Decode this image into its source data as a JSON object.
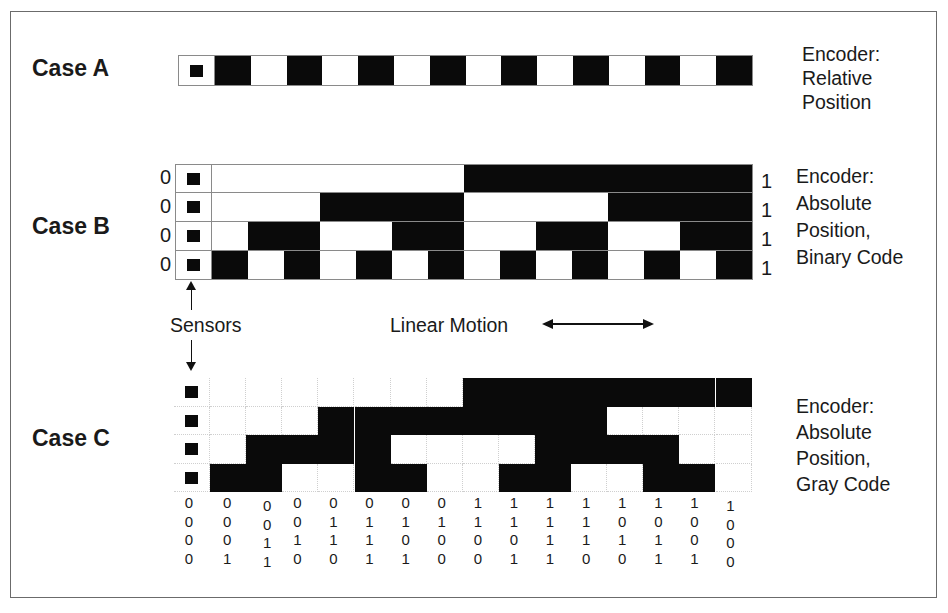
{
  "caseA": {
    "label": "Case A",
    "description": [
      "Encoder:",
      "Relative",
      "Position"
    ],
    "pattern": [
      1,
      0,
      1,
      0,
      1,
      0,
      1,
      0,
      1,
      0,
      1,
      0,
      1,
      0,
      1
    ]
  },
  "caseB": {
    "label": "Case B",
    "description": [
      "Encoder:",
      "Absolute",
      "Position,",
      "Binary Code"
    ],
    "left_bits": [
      "0",
      "0",
      "0",
      "0"
    ],
    "right_bits": [
      "1",
      "1",
      "1",
      "1"
    ],
    "rows": [
      [
        0,
        0,
        0,
        0,
        0,
        0,
        0,
        0,
        1,
        1,
        1,
        1,
        1,
        1,
        1,
        1
      ],
      [
        0,
        0,
        0,
        0,
        1,
        1,
        1,
        1,
        0,
        0,
        0,
        0,
        1,
        1,
        1,
        1
      ],
      [
        0,
        0,
        1,
        1,
        0,
        0,
        1,
        1,
        0,
        0,
        1,
        1,
        0,
        0,
        1,
        1
      ],
      [
        0,
        1,
        0,
        1,
        0,
        1,
        0,
        1,
        0,
        1,
        0,
        1,
        0,
        1,
        0,
        1
      ]
    ]
  },
  "caseC": {
    "label": "Case C",
    "description": [
      "Encoder:",
      "Absolute",
      "Position,",
      "Gray Code"
    ],
    "rows": [
      [
        0,
        0,
        0,
        0,
        0,
        0,
        0,
        0,
        1,
        1,
        1,
        1,
        1,
        1,
        1,
        1
      ],
      [
        0,
        0,
        0,
        0,
        1,
        1,
        1,
        1,
        1,
        1,
        1,
        1,
        0,
        0,
        0,
        0
      ],
      [
        0,
        0,
        1,
        1,
        1,
        1,
        0,
        0,
        0,
        0,
        1,
        1,
        1,
        1,
        0,
        0
      ],
      [
        0,
        1,
        1,
        0,
        0,
        1,
        1,
        0,
        0,
        1,
        1,
        0,
        0,
        1,
        1,
        0
      ]
    ],
    "code_columns": [
      [
        "0",
        "0",
        "0",
        "0"
      ],
      [
        "0",
        "0",
        "0",
        "1"
      ],
      [
        "0",
        "0",
        "1",
        "1"
      ],
      [
        "0",
        "0",
        "1",
        "0"
      ],
      [
        "0",
        "1",
        "1",
        "0"
      ],
      [
        "0",
        "1",
        "1",
        "1"
      ],
      [
        "0",
        "1",
        "0",
        "1"
      ],
      [
        "0",
        "1",
        "0",
        "0"
      ],
      [
        "1",
        "1",
        "0",
        "0"
      ],
      [
        "1",
        "1",
        "0",
        "1"
      ],
      [
        "1",
        "1",
        "1",
        "1"
      ],
      [
        "1",
        "1",
        "1",
        "0"
      ],
      [
        "1",
        "0",
        "1",
        "0"
      ],
      [
        "1",
        "0",
        "1",
        "1"
      ],
      [
        "1",
        "0",
        "0",
        "1"
      ],
      [
        "1",
        "0",
        "0",
        "0"
      ]
    ]
  },
  "annotations": {
    "sensors": "Sensors",
    "linear_motion": "Linear Motion"
  },
  "colors": {
    "mark": "#0a0a0a",
    "background": "#ffffff",
    "frame": "#6b6b6b",
    "grid_line": "#cfcfcf"
  }
}
